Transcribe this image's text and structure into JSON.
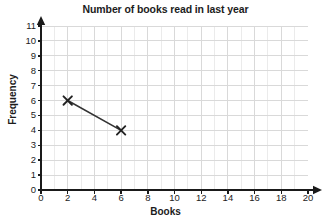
{
  "chart_data": {
    "type": "line",
    "title": "Number of books read in last year",
    "xlabel": "Books",
    "ylabel": "Frequency",
    "xlim": [
      0,
      20
    ],
    "ylim": [
      0,
      11
    ],
    "xticks": [
      0,
      2,
      4,
      6,
      8,
      10,
      12,
      14,
      16,
      18,
      20
    ],
    "yticks": [
      0,
      1,
      2,
      3,
      4,
      5,
      6,
      7,
      8,
      9,
      10,
      11
    ],
    "grid": true,
    "grid_minor_step_x": 1,
    "grid_minor_step_y": 1,
    "legend": null,
    "marker": "x",
    "series": [
      {
        "name": "Books read",
        "x": [
          2,
          6
        ],
        "y": [
          6,
          4
        ],
        "points": [
          {
            "x": 2,
            "y": 6
          },
          {
            "x": 6,
            "y": 4
          }
        ]
      }
    ],
    "colors": {
      "line": "#333333",
      "marker": "#222222",
      "axis": "#1a1a1a",
      "grid": "#d9d9d9",
      "background": "#ffffff"
    }
  }
}
